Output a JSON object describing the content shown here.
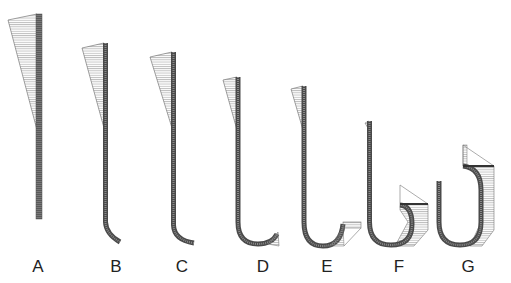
{
  "figure": {
    "colors": {
      "bar": "#6a6a6a",
      "bar_dark": "#3c3c3c",
      "hatch": "#8a8a8a",
      "outline": "#777777",
      "label": "#222222"
    },
    "panels": [
      {
        "id": "A",
        "label": "A",
        "x": 38
      },
      {
        "id": "B",
        "label": "B",
        "x": 116
      },
      {
        "id": "C",
        "label": "C",
        "x": 182
      },
      {
        "id": "D",
        "label": "D",
        "x": 263
      },
      {
        "id": "E",
        "label": "E",
        "x": 327
      },
      {
        "id": "F",
        "label": "F",
        "x": 399
      },
      {
        "id": "G",
        "label": "G",
        "x": 468
      }
    ]
  }
}
